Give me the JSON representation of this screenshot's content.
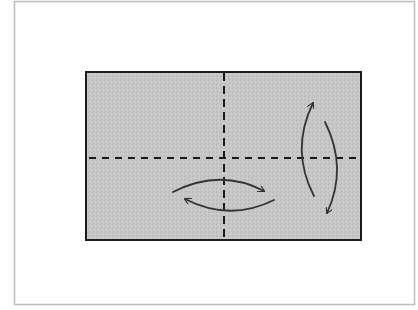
{
  "diagram": {
    "type": "origami-fold-instruction",
    "colors": {
      "background": "#ffffff",
      "frame_border": "#bdbdbd",
      "paper_fill": "#c4c4c4",
      "paper_border": "#1a1a1a",
      "fold_line": "#1a1a1a",
      "arrow": "#333333"
    },
    "frame": {
      "x": 14,
      "y": 1,
      "width": 400,
      "height": 303
    },
    "paper": {
      "x": 86,
      "y": 72,
      "width": 275,
      "height": 168
    },
    "fold_lines": [
      {
        "name": "vertical-center-fold",
        "style": "dashed",
        "x1": 224,
        "y1": 73,
        "x2": 224,
        "y2": 239
      },
      {
        "name": "horizontal-center-fold",
        "style": "dashed",
        "x1": 89,
        "y1": 158,
        "x2": 359,
        "y2": 158
      }
    ],
    "arrows": [
      {
        "name": "fold-right-arrow",
        "direction": "right",
        "path": "M 173 192 Q 220 168 264 191"
      },
      {
        "name": "unfold-left-arrow",
        "direction": "left",
        "path": "M 274 200 Q 230 222 185 199"
      },
      {
        "name": "fold-up-arrow",
        "direction": "up",
        "path": "M 314 196 Q 290 150 313 103"
      },
      {
        "name": "unfold-down-arrow",
        "direction": "down",
        "path": "M 325 122 Q 348 168 327 213"
      }
    ]
  }
}
